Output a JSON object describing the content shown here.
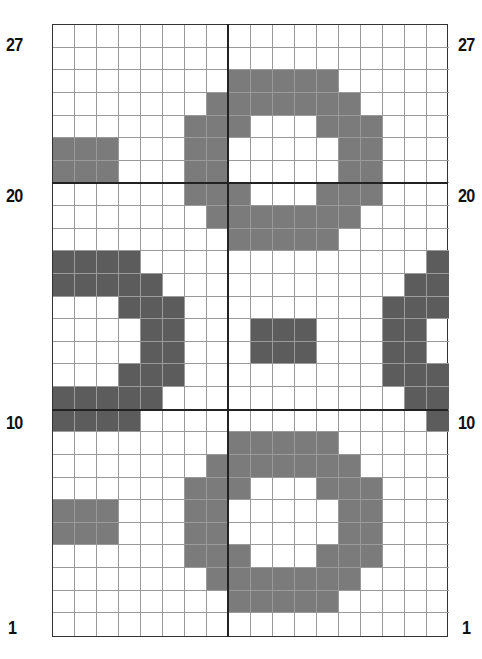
{
  "chart": {
    "columns": 18,
    "rows": 27,
    "colors": {
      "empty": "#ffffff",
      "light": "#7b7b7b",
      "dark": "#5c5c5c",
      "gridline": "#9a9a9a",
      "divider": "#222222"
    },
    "row_labels_left": [
      {
        "label": "27",
        "row": 27
      },
      {
        "label": "20",
        "row": 20
      },
      {
        "label": "10",
        "row": 10
      },
      {
        "label": "1",
        "row": 1
      }
    ],
    "row_labels_right": [
      {
        "label": "27",
        "row": 27
      },
      {
        "label": "20",
        "row": 20
      },
      {
        "label": "10",
        "row": 10
      },
      {
        "label": "1",
        "row": 1
      }
    ],
    "divider_lines": {
      "vertical_after_column": 8,
      "horizontal_above_rows": [
        20,
        10
      ]
    },
    "cells_top_to_bottom": [
      "000000000000000000",
      "000000000000000000",
      "000000001111100000",
      "000000011111110000",
      "000000111000111000",
      "111000110000011000",
      "111000110000011000",
      "000000111000111000",
      "000000011111110000",
      "000000001111100000",
      "222200000000000002",
      "222220000000000022",
      "000222000000000222",
      "000022000222000220",
      "000022000222000220",
      "000222000000000222",
      "222220000000000022",
      "222200000000000002",
      "000000001111100000",
      "000000011111110000",
      "000000111000111000",
      "111000110000011000",
      "111000110000011000",
      "000000111000111000",
      "000000011111110000",
      "000000001111100000",
      "000000000000000000"
    ]
  }
}
